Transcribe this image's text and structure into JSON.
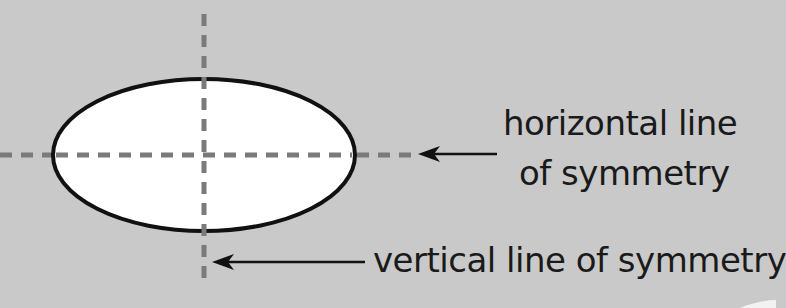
{
  "diagram": {
    "shape": "ellipse",
    "labels": {
      "horizontal_line_1": "horizontal line",
      "horizontal_line_2": "of symmetry",
      "vertical": "vertical line of symmetry"
    },
    "colors": {
      "background": "#c9c9c9",
      "ellipse_fill": "#ffffff",
      "ellipse_stroke": "#111111",
      "dash": "#777777",
      "arrow": "#111111"
    }
  }
}
